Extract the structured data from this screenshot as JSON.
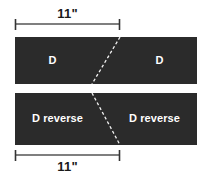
{
  "figure": {
    "background_color": "#ffffff",
    "panel_color": "#2b2b2b",
    "seam_color": "#ffffff",
    "dimension_color": "#555555",
    "dimension_text_color": "#1a1a1a"
  },
  "dimensions": {
    "top": {
      "label": "11\"",
      "tick_left_x": 15,
      "tick_right_x": 120,
      "line_y": 24
    },
    "bottom": {
      "label": "11\"",
      "tick_left_x": 15,
      "tick_right_x": 120,
      "line_y": 155
    }
  },
  "panels": [
    {
      "name": "top-strip",
      "x": 15,
      "y": 37,
      "width": 182,
      "height": 47,
      "seam": {
        "x1": 120,
        "y1": 37,
        "x2": 92,
        "y2": 84
      },
      "regions": [
        {
          "label": "D"
        },
        {
          "label": "D"
        }
      ]
    },
    {
      "name": "bottom-strip",
      "x": 15,
      "y": 93,
      "width": 182,
      "height": 52,
      "seam": {
        "x1": 92,
        "y1": 93,
        "x2": 120,
        "y2": 145
      },
      "regions": [
        {
          "label": "D reverse"
        },
        {
          "label": "D reverse"
        }
      ]
    }
  ]
}
